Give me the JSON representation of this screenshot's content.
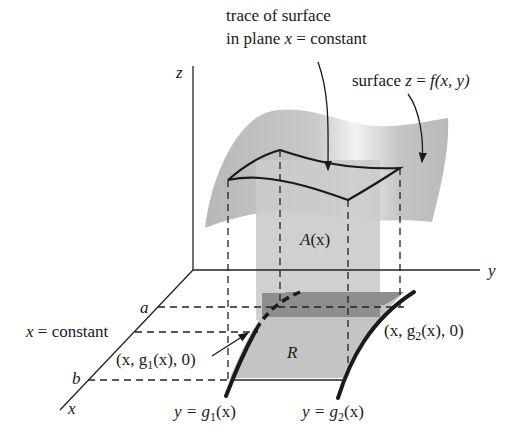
{
  "figure": {
    "annotations": {
      "trace_line1": "trace of surface",
      "trace_line2_prefix": "in plane ",
      "trace_line2_var": "x",
      "trace_line2_suffix": " = constant",
      "surface_prefix": "surface ",
      "surface_eq_z": "z",
      "surface_eq_rest": " = ",
      "surface_eq_f": "f",
      "surface_eq_args": "(x, y)"
    },
    "axes": {
      "z": "z",
      "y": "y",
      "x": "x"
    },
    "x_axis_marks": {
      "a": "a",
      "b": "b",
      "x_constant_var": "x",
      "x_constant_rest": " = constant"
    },
    "regions": {
      "cross_section": "A(x)",
      "cross_section_var": "A",
      "cross_section_arg": "(x)",
      "base_region": "R"
    },
    "points": {
      "lower": {
        "open": "(x, g",
        "sub": "1",
        "close": "(x), 0)"
      },
      "upper": {
        "open": "(x, g",
        "sub": "2",
        "close": "(x), 0)"
      }
    },
    "curves": {
      "g1": {
        "lhs": "y = g",
        "sub": "1",
        "rhs": "(x)"
      },
      "g2": {
        "lhs": "y = g",
        "sub": "2",
        "rhs": "(x)"
      }
    },
    "colors": {
      "surface": "#bdbdbd",
      "surface_highlight": "#ececec",
      "cross_section": "#cfcfcf",
      "region_R": "#c6c6c6",
      "strip": "#8f8f8f",
      "ink": "#1a1a1a"
    }
  }
}
